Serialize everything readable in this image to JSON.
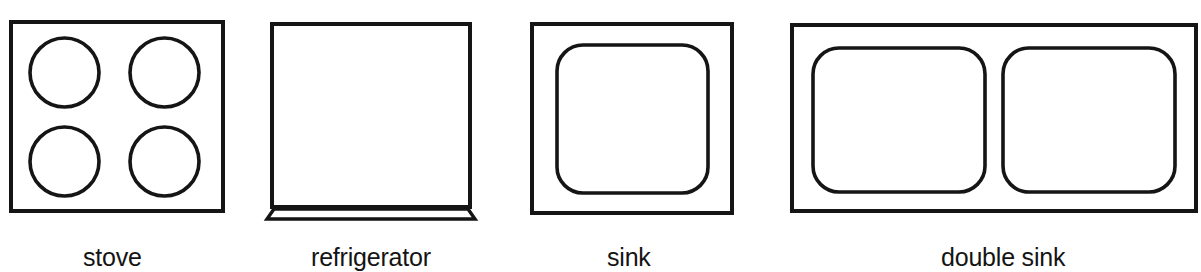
{
  "page": {
    "background_color": "#ffffff",
    "stroke_color": "#151515",
    "text_color": "#141414",
    "width": 1201,
    "height": 272
  },
  "figures": [
    {
      "id": "stove",
      "label": "stove",
      "icon_name": "stove-icon",
      "description": "square cooktop outline with four circular burners",
      "burner_count": 4,
      "outline": {
        "x": 11,
        "y": 22,
        "width": 212,
        "height": 189
      },
      "stroke_width": 4,
      "burners": [
        {
          "cx": 64.5,
          "cy": 72.5,
          "r": 34.5
        },
        {
          "cx": 164.5,
          "cy": 72.5,
          "r": 34.5
        },
        {
          "cx": 64.5,
          "cy": 161.5,
          "r": 34.5
        },
        {
          "cx": 164.5,
          "cy": 161.5,
          "r": 34.5
        }
      ],
      "label_x": 83,
      "label_y": 243
    },
    {
      "id": "refrigerator",
      "label": "refrigerator",
      "icon_name": "refrigerator-icon",
      "description": "tall rectangular cabinet outline with flared base plinth",
      "outline": {
        "x": 272,
        "y": 24,
        "width": 198,
        "height": 183
      },
      "stroke_width": 4,
      "base": {
        "top_left_x": 274,
        "top_right_x": 468,
        "bottom_left_x": 267,
        "bottom_right_x": 475,
        "top_y": 209,
        "bottom_y": 219
      },
      "label_x": 311,
      "label_y": 243
    },
    {
      "id": "sink",
      "label": "sink",
      "icon_name": "sink-icon",
      "description": "rectangular counter outline with one rounded basin",
      "basin_count": 1,
      "outline": {
        "x": 532,
        "y": 24,
        "width": 200,
        "height": 189
      },
      "stroke_width": 4,
      "basins": [
        {
          "x": 557,
          "y": 45,
          "width": 151,
          "height": 148,
          "radius": 26
        }
      ],
      "label_x": 607,
      "label_y": 243
    },
    {
      "id": "double-sink",
      "label": "double sink",
      "icon_name": "double-sink-icon",
      "description": "wide rectangular counter outline with two rounded basins",
      "basin_count": 2,
      "outline": {
        "x": 792,
        "y": 25,
        "width": 404,
        "height": 186
      },
      "stroke_width": 4,
      "basins": [
        {
          "x": 813,
          "y": 48,
          "width": 172,
          "height": 144,
          "radius": 26
        },
        {
          "x": 1003,
          "y": 48,
          "width": 172,
          "height": 144,
          "radius": 26
        }
      ],
      "label_x": 941,
      "label_y": 243
    }
  ]
}
